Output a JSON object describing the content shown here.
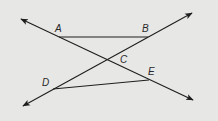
{
  "diagram": {
    "background": "#e7e7e6",
    "stroke": "#1e1e1e",
    "lines": [
      {
        "name": "line-through-A-C-E",
        "from": [
          21,
          19
        ],
        "to": [
          193,
          100
        ],
        "arrows": "both"
      },
      {
        "name": "line-through-D-C-B",
        "from": [
          23,
          106
        ],
        "to": [
          192,
          13
        ],
        "arrows": "both"
      }
    ],
    "segments": [
      {
        "name": "segment-AB",
        "from": "A",
        "to": "B"
      },
      {
        "name": "segment-DE",
        "from": "D",
        "to": "E"
      }
    ],
    "points": {
      "A": {
        "label": "A",
        "x": 59,
        "y": 37,
        "lx": 55,
        "ly": 32
      },
      "B": {
        "label": "B",
        "x": 148,
        "y": 37,
        "lx": 142,
        "ly": 32
      },
      "C": {
        "label": "C",
        "x": 108,
        "y": 60,
        "lx": 120,
        "ly": 63
      },
      "D": {
        "label": "D",
        "x": 53,
        "y": 89,
        "lx": 42,
        "ly": 86
      },
      "E": {
        "label": "E",
        "x": 149,
        "y": 80,
        "lx": 148,
        "ly": 75
      }
    }
  }
}
